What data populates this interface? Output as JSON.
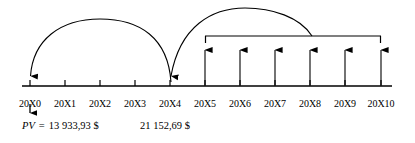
{
  "diagram": {
    "type": "cash-flow-timeline",
    "title": "",
    "axis": {
      "label": "time-axis",
      "y": 86,
      "x_start": 22,
      "x_end": 392
    },
    "periods": [
      {
        "label": "20X0",
        "x": 30,
        "index": 0
      },
      {
        "label": "20X1",
        "x": 65,
        "index": 1
      },
      {
        "label": "20X2",
        "x": 100,
        "index": 2
      },
      {
        "label": "20X3",
        "x": 135,
        "index": 3
      },
      {
        "label": "20X4",
        "x": 170,
        "index": 4
      },
      {
        "label": "20X5",
        "x": 205,
        "index": 5
      },
      {
        "label": "20X6",
        "x": 240,
        "index": 6
      },
      {
        "label": "20X7",
        "x": 275,
        "index": 7
      },
      {
        "label": "20X8",
        "x": 310,
        "index": 8
      },
      {
        "label": "20X9",
        "x": 345,
        "index": 9
      },
      {
        "label": "20X10",
        "x": 381,
        "index": 10
      }
    ],
    "label_y": 98,
    "cash_inflow_arrows": [
      {
        "x": 205,
        "period": "20X5",
        "top": 42
      },
      {
        "x": 240,
        "period": "20X6",
        "top": 42
      },
      {
        "x": 275,
        "period": "20X7",
        "top": 42
      },
      {
        "x": 310,
        "period": "20X8",
        "top": 42
      },
      {
        "x": 345,
        "period": "20X9",
        "top": 42
      },
      {
        "x": 381,
        "period": "20X10",
        "top": 42
      }
    ],
    "annuity_bracket": {
      "name": "annuity-bracket",
      "from_period": "20X5",
      "to_period": "20X10",
      "x_start": 205,
      "x_end": 381,
      "y": 36
    },
    "discount_arcs": [
      {
        "name": "discount-arc-20X4-to-20X0",
        "from_period": "20X4",
        "to_period": "20X0",
        "from_x": 170,
        "to_x": 30,
        "peak_y": 20,
        "direction": "right-to-left"
      },
      {
        "name": "discount-arc-bracket-to-20X4",
        "from_period": "20X8",
        "to_period": "20X4",
        "from_x": 312,
        "to_x": 170,
        "peak_y": 10,
        "direction": "right-to-left"
      }
    ],
    "pv_marker_arrow": {
      "name": "pv-down-arrow",
      "x": 30,
      "y_top": 104,
      "y_bottom": 118
    },
    "values": [
      {
        "name": "present-value-20X0",
        "prefix": "PV",
        "equals": "=",
        "amount": "13 933,93 $",
        "full_text": "PV  =  13 933,93 $",
        "x": 22,
        "y": 126,
        "at_period": "20X0"
      },
      {
        "name": "value-at-20X4",
        "prefix": "",
        "equals": "",
        "amount": "21 152,69 $",
        "full_text": "21 152,69 $",
        "x": 140,
        "y": 126,
        "at_period": "20X4"
      }
    ],
    "colors": {
      "stroke": "#000000",
      "background": "#ffffff",
      "text": "#000000"
    }
  }
}
